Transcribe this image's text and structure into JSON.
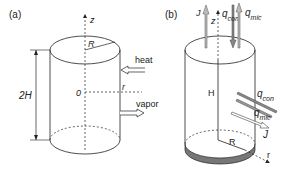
{
  "panel_a": {
    "tag": "(a)",
    "axis_z": "z",
    "radius": "R",
    "height": "2H",
    "origin": "0",
    "axis_r": "r",
    "arrow_in": "heat",
    "arrow_out": "vapor"
  },
  "panel_b": {
    "tag": "(b)",
    "top_J": "J",
    "axis_z": "z",
    "top_qcon": "q",
    "top_qcon_sub": "con",
    "top_qmic": "q",
    "top_qmic_sub": "mic",
    "height": "H",
    "radius": "R",
    "axis_r": "r",
    "side_qcon": "q",
    "side_qcon_sub": "con",
    "side_qmic": "q",
    "side_qmic_sub": "mic",
    "side_J": "J"
  },
  "colors": {
    "line": "#222222",
    "arrow_fill": "#bbbbbb",
    "base_fill": "#777777"
  }
}
